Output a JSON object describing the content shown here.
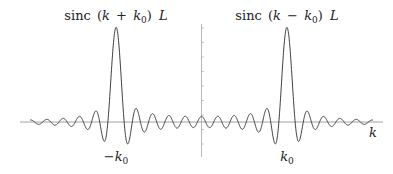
{
  "chart_data": {
    "type": "line",
    "title": "",
    "xlabel": "k",
    "ylabel": "",
    "series": [
      {
        "name": "sinc (k + k0) L",
        "label_parts": [
          "sinc",
          " (",
          "k",
          " + ",
          "k",
          "0",
          ") ",
          "L"
        ],
        "center_label": "−k0",
        "center": -1,
        "peak": 1.0
      },
      {
        "name": "sinc (k − k0) L",
        "label_parts": [
          "sinc",
          " (",
          "k",
          " − ",
          "k",
          "0",
          ") ",
          "L"
        ],
        "center_label": "k0",
        "center": 1,
        "peak": 1.0
      }
    ],
    "x_tick_labels": [
      "−k0",
      "k0"
    ],
    "axis_label_x": "k",
    "grid": false,
    "legend": "none",
    "annotations": [
      "sinc (k + k0) L",
      "sinc (k − k0) L",
      "−k0",
      "k0",
      "k"
    ]
  },
  "labels": {
    "left_peak": {
      "fn": "sinc",
      "open": "(",
      "k": "k",
      "op": "+",
      "k0": "k",
      "sub": "0",
      "close": ")",
      "L": "L"
    },
    "right_peak": {
      "fn": "sinc",
      "open": "(",
      "k": "k",
      "op": "−",
      "k0": "k",
      "sub": "0",
      "close": ")",
      "L": "L"
    },
    "neg_k0": {
      "sign": "−",
      "k": "k",
      "sub": "0"
    },
    "pos_k0": {
      "k": "k",
      "sub": "0"
    },
    "x_axis": "k"
  },
  "colors": {
    "curve": "#2a2a2a",
    "axis": "#8a8a8a",
    "text": "#222222"
  }
}
